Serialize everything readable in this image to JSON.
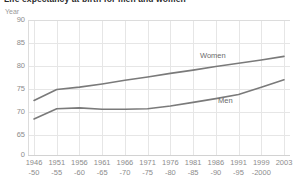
{
  "chart_data": {
    "type": "line",
    "title": "Life expectancy at birth for men and women",
    "ylabel": "Year",
    "xlabel": "",
    "grid": true,
    "legend_position": "inline-right",
    "ylim": [
      65,
      90
    ],
    "yticks": [
      "90",
      "85",
      "80",
      "75",
      "70",
      "65",
      "0"
    ],
    "categories": [
      {
        "line1": "1946",
        "line2": "-50"
      },
      {
        "line1": "1951",
        "line2": "-55"
      },
      {
        "line1": "1956",
        "line2": "-60"
      },
      {
        "line1": "1961",
        "line2": "-65"
      },
      {
        "line1": "1966",
        "line2": "-70"
      },
      {
        "line1": "1971",
        "line2": "-75"
      },
      {
        "line1": "1976",
        "line2": "-80"
      },
      {
        "line1": "1981",
        "line2": "-85"
      },
      {
        "line1": "1986",
        "line2": "-90"
      },
      {
        "line1": "1991",
        "line2": "-95"
      },
      {
        "line1": "1999",
        "line2": "-2000"
      },
      {
        "line1": "2003",
        "line2": ""
      }
    ],
    "series": [
      {
        "name": "Women",
        "color": "#7a7a7a",
        "values": [
          72.5,
          74.9,
          75.4,
          76.1,
          76.9,
          77.6,
          78.4,
          79.1,
          79.9,
          80.6,
          81.3,
          82.1
        ]
      },
      {
        "name": "Men",
        "color": "#7a7a7a",
        "values": [
          68.5,
          70.7,
          70.9,
          70.6,
          70.6,
          70.7,
          71.3,
          72.1,
          72.9,
          73.8,
          75.4,
          77.0
        ]
      }
    ]
  },
  "colors": {
    "series_line": "#7a7a7a",
    "grid": "#e6e6e6",
    "axis": "#d2d2d2",
    "tick_text": "#8c8c8c",
    "title_text": "#2b2b2b",
    "label_text": "#6b6b6b"
  }
}
